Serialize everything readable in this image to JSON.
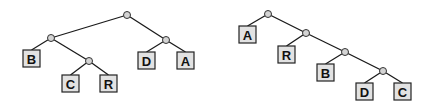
{
  "trees": [
    {
      "name": "balanced-tree",
      "nodes": [
        {
          "id": "r",
          "x": 127,
          "y": 15
        },
        {
          "id": "l",
          "x": 51,
          "y": 38
        },
        {
          "id": "rr",
          "x": 166,
          "y": 40
        },
        {
          "id": "lr",
          "x": 89,
          "y": 61
        }
      ],
      "edges": [
        [
          "r",
          "l"
        ],
        [
          "r",
          "rr"
        ],
        [
          "l",
          "B"
        ],
        [
          "l",
          "lr"
        ],
        [
          "lr",
          "C"
        ],
        [
          "lr",
          "R"
        ],
        [
          "rr",
          "D"
        ],
        [
          "rr",
          "A"
        ]
      ],
      "leaves": [
        {
          "id": "B",
          "label": "B",
          "x": 23,
          "y": 50
        },
        {
          "id": "C",
          "label": "C",
          "x": 62,
          "y": 75
        },
        {
          "id": "R",
          "label": "R",
          "x": 100,
          "y": 75
        },
        {
          "id": "D",
          "label": "D",
          "x": 138,
          "y": 52
        },
        {
          "id": "A",
          "label": "A",
          "x": 177,
          "y": 52
        }
      ]
    },
    {
      "name": "caterpillar-tree",
      "nodes": [
        {
          "id": "n1",
          "x": 268,
          "y": 14
        },
        {
          "id": "n2",
          "x": 306,
          "y": 33
        },
        {
          "id": "n3",
          "x": 345,
          "y": 52
        },
        {
          "id": "n4",
          "x": 383,
          "y": 71
        }
      ],
      "edges": [
        [
          "n1",
          "A"
        ],
        [
          "n1",
          "n2"
        ],
        [
          "n2",
          "R"
        ],
        [
          "n2",
          "n3"
        ],
        [
          "n3",
          "B"
        ],
        [
          "n3",
          "n4"
        ],
        [
          "n4",
          "D"
        ],
        [
          "n4",
          "C"
        ]
      ],
      "leaves": [
        {
          "id": "A",
          "label": "A",
          "x": 239,
          "y": 26
        },
        {
          "id": "R",
          "label": "R",
          "x": 278,
          "y": 46
        },
        {
          "id": "B",
          "label": "B",
          "x": 317,
          "y": 64
        },
        {
          "id": "D",
          "label": "D",
          "x": 356,
          "y": 83
        },
        {
          "id": "C",
          "label": "C",
          "x": 394,
          "y": 83
        }
      ]
    }
  ],
  "leaf_size": 17,
  "node_radius": 3.5
}
